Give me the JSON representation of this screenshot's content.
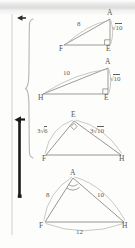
{
  "page": {
    "width": 135,
    "height": 248,
    "background_color": "#fdfdfc",
    "ink_color": "#5d5d5d"
  },
  "margin_marks": {
    "rule_label": "vertical margin rule",
    "arrow_top_label": "left arrow",
    "arrow_bottom_label": "left arrow",
    "brace_label": "curly brace",
    "bar_label": "solid vertical marker bar"
  },
  "figures": [
    {
      "id": "figure-1",
      "type": "right-triangle",
      "vertices": [
        {
          "name": "A",
          "label": "A",
          "x": 110,
          "y": 19
        },
        {
          "name": "F",
          "label": "F",
          "x": 64,
          "y": 45
        },
        {
          "name": "E",
          "label": "E",
          "x": 110,
          "y": 45
        }
      ],
      "right_angle_at": "E",
      "labels": [
        {
          "name": "side-FA",
          "text": "8",
          "radical": false,
          "x": 78,
          "y": 25
        },
        {
          "name": "side-AE",
          "text": "10",
          "radical": true,
          "x": 113,
          "y": 29
        }
      ]
    },
    {
      "id": "figure-2",
      "type": "right-triangle",
      "vertices": [
        {
          "name": "A",
          "label": "A",
          "x": 108,
          "y": 68
        },
        {
          "name": "H",
          "label": "H",
          "x": 43,
          "y": 94
        },
        {
          "name": "E",
          "label": "E",
          "x": 108,
          "y": 94
        }
      ],
      "right_angle_at": "E",
      "labels": [
        {
          "name": "side-HA",
          "text": "10",
          "radical": false,
          "x": 66,
          "y": 73
        },
        {
          "name": "side-AE",
          "text": "10",
          "radical": true,
          "x": 111,
          "y": 79
        }
      ]
    },
    {
      "id": "figure-3",
      "type": "right-triangle",
      "vertices": [
        {
          "name": "E",
          "label": "E",
          "x": 74,
          "y": 121
        },
        {
          "name": "F",
          "label": "F",
          "x": 46,
          "y": 155
        },
        {
          "name": "H",
          "label": "H",
          "x": 121,
          "y": 155
        }
      ],
      "right_angle_at": "E",
      "labels": [
        {
          "name": "side-FE",
          "text": "3",
          "radicand": "6",
          "radical": true,
          "x": 43,
          "y": 131
        },
        {
          "name": "side-EH",
          "text": "3",
          "radicand": "10",
          "radical": true,
          "x": 93,
          "y": 131
        }
      ]
    },
    {
      "id": "figure-4",
      "type": "triangle",
      "vertices": [
        {
          "name": "A",
          "label": "A",
          "x": 73,
          "y": 178
        },
        {
          "name": "F",
          "label": "F",
          "x": 45,
          "y": 222
        },
        {
          "name": "H",
          "label": "H",
          "x": 124,
          "y": 222
        }
      ],
      "angle_mark_at": "A",
      "labels": [
        {
          "name": "side-FA",
          "text": "8",
          "radical": false,
          "x": 49,
          "y": 196
        },
        {
          "name": "side-AH",
          "text": "10",
          "radical": false,
          "x": 100,
          "y": 196
        },
        {
          "name": "side-FH",
          "text": "12",
          "radical": false,
          "x": 79,
          "y": 233
        }
      ]
    }
  ]
}
